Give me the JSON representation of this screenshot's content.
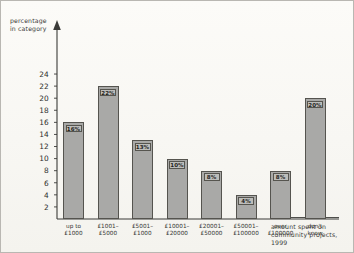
{
  "chart_data": {
    "type": "bar",
    "title": "",
    "xlabel": "amount spent on\ncommunity projects, 1999",
    "ylabel": "percentage\nin category",
    "categories": [
      "up to\n£1000",
      "£1001–\n£5000",
      "£5001–\n£1000",
      "£10001–\n£20000",
      "£20001–\n£50000",
      "£50001–\n£100000",
      "over\n£100000",
      "don't\nknow"
    ],
    "values": [
      16,
      22,
      13,
      10,
      8,
      4,
      8,
      20
    ],
    "value_labels": [
      "16%",
      "22%",
      "13%",
      "10%",
      "8%",
      "4%",
      "8%",
      "20%"
    ],
    "ylim": [
      0,
      25
    ],
    "yticks": [
      2,
      4,
      6,
      8,
      10,
      12,
      14,
      16,
      18,
      20,
      22,
      24
    ],
    "grid": false,
    "legend": null,
    "bar_color": "#a9a9a7",
    "bar_edge_color": "#55544f",
    "axis_color": "#3b3b38"
  }
}
